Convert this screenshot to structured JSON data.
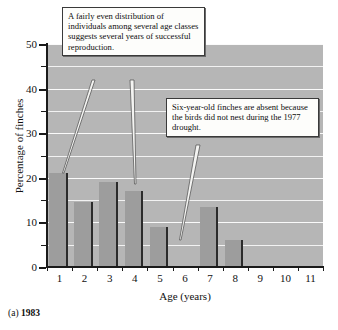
{
  "caption": {
    "prefix": "(a)",
    "year": "1983"
  },
  "annotations": [
    {
      "id": "even-distribution-note",
      "text": "A fairly even distribution of individuals among several age classes suggests several years of successful reproduction."
    },
    {
      "id": "drought-note",
      "text": "Six-year-old finches are absent because the birds did not nest during the 1977 drought."
    }
  ],
  "chart_data": {
    "type": "bar",
    "title": "",
    "subtitle": "",
    "xlabel": "Age (years)",
    "ylabel": "Percentage of finches",
    "categories": [
      "1",
      "2",
      "3",
      "4",
      "5",
      "6",
      "7",
      "8",
      "9",
      "10",
      "11"
    ],
    "values": [
      21,
      14.5,
      19,
      17,
      9,
      0,
      13.5,
      6,
      0,
      0,
      0
    ],
    "ylim": [
      0,
      50
    ],
    "yticks": [
      0,
      10,
      20,
      30,
      40,
      50
    ],
    "yticks_minor": [
      5,
      15,
      25,
      35,
      45
    ],
    "ytick_labels": [
      "0",
      "10",
      "20",
      "30",
      "40",
      "50"
    ],
    "grid": true,
    "grid_orientation": "horizontal",
    "legend": false,
    "legend_position": "none",
    "bar_color": "#9d9d9d",
    "bar_edge_color": "#2b2b2b",
    "plot_background": "#b6b6b6",
    "gridline_color": "#fafafa",
    "axis_color": "#1a1a1a",
    "annotation_targets": [
      {
        "category": "1",
        "value": 21
      },
      {
        "category": "4",
        "value": 17
      },
      {
        "category": "6",
        "value": 0
      }
    ]
  }
}
